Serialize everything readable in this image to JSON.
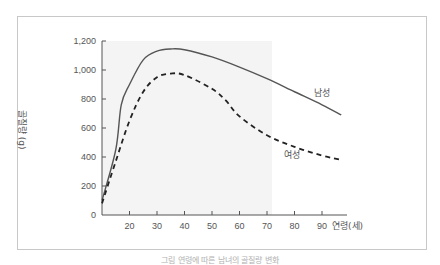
{
  "chart_data": {
    "type": "line",
    "title": "",
    "xlabel": "연령(세)",
    "ylabel": "골질량 (g)",
    "xlim": [
      10,
      97
    ],
    "ylim": [
      0,
      1200
    ],
    "x_ticks": [
      20,
      30,
      40,
      50,
      60,
      70,
      80,
      90
    ],
    "y_ticks": [
      0,
      200,
      400,
      600,
      800,
      1000,
      1200
    ],
    "y_tick_labels": [
      "0",
      "200",
      "400",
      "600",
      "800",
      "1,000",
      "1,200"
    ],
    "grid": false,
    "legend_position": "inline",
    "series": [
      {
        "name": "남성",
        "style": "solid",
        "color": "#555555",
        "x": [
          10,
          15,
          17,
          20,
          25,
          30,
          35,
          40,
          50,
          60,
          70,
          80,
          90,
          97
        ],
        "values": [
          100,
          450,
          760,
          900,
          1070,
          1130,
          1145,
          1140,
          1090,
          1020,
          940,
          850,
          760,
          690
        ]
      },
      {
        "name": "여성",
        "style": "dashed",
        "color": "#222222",
        "x": [
          10,
          15,
          20,
          25,
          30,
          35,
          40,
          50,
          55,
          60,
          70,
          80,
          90,
          97
        ],
        "values": [
          80,
          370,
          650,
          850,
          950,
          975,
          965,
          870,
          790,
          680,
          550,
          470,
          410,
          380
        ]
      }
    ],
    "annotations": [
      {
        "text": "남성",
        "x": 90,
        "y": 820
      },
      {
        "text": "여성",
        "x": 79,
        "y": 390
      }
    ]
  },
  "labels": {
    "y_axis_title": "골질량 (g)",
    "x_axis_title": "연령(세)",
    "male": "남성",
    "female": "여성",
    "caption": "그림   연령에 따른 남녀의 골질량 변화"
  }
}
